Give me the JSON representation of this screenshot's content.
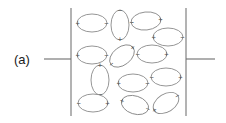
{
  "figure": {
    "panel_label": "(a)",
    "width": 226,
    "height": 123,
    "colors": {
      "background": "#ffffff",
      "plate_stroke": "#808080",
      "lead_stroke": "#6e6e6e",
      "dipole_stroke": "#8a8a8a",
      "dipole_fill": "#ffffff",
      "charge_text": "#4a4a4a",
      "label_text": "#1a1a1a"
    },
    "plates": [
      {
        "name": "left-plate",
        "x": 71,
        "y1": 8,
        "y2": 116
      },
      {
        "name": "right-plate",
        "x": 186,
        "y1": 8,
        "y2": 116
      }
    ],
    "leads": [
      {
        "name": "left-lead",
        "x1": 44,
        "y1": 59,
        "x2": 71,
        "y2": 59
      },
      {
        "name": "right-lead",
        "x1": 186,
        "y1": 59,
        "x2": 215,
        "y2": 59
      }
    ],
    "label_position": {
      "x": 14,
      "y": 60
    },
    "dipoles": [
      {
        "id": 1,
        "cx": 92,
        "cy": 23,
        "rx": 15,
        "ry": 9,
        "rotation": 0,
        "plus": "+",
        "minus": "−",
        "plus_side": "left"
      },
      {
        "id": 2,
        "cx": 120,
        "cy": 25,
        "rx": 9,
        "ry": 15,
        "rotation": 0,
        "plus": "+",
        "minus": "−",
        "plus_side": "bottom"
      },
      {
        "id": 3,
        "cx": 146,
        "cy": 21,
        "rx": 15,
        "ry": 9,
        "rotation": -6,
        "plus": "+",
        "minus": "−",
        "plus_side": "right"
      },
      {
        "id": 4,
        "cx": 168,
        "cy": 37,
        "rx": 15,
        "ry": 9,
        "rotation": 0,
        "plus": "+",
        "minus": "−",
        "plus_side": "left"
      },
      {
        "id": 5,
        "cx": 92,
        "cy": 55,
        "rx": 15,
        "ry": 9,
        "rotation": 0,
        "plus": "+",
        "minus": "−",
        "plus_side": "left"
      },
      {
        "id": 6,
        "cx": 122,
        "cy": 56,
        "rx": 14,
        "ry": 9,
        "rotation": -38,
        "plus": "+",
        "minus": "−",
        "plus_side": "right"
      },
      {
        "id": 7,
        "cx": 152,
        "cy": 54,
        "rx": 15,
        "ry": 9,
        "rotation": 0,
        "plus": "+",
        "minus": "−",
        "plus_side": "right"
      },
      {
        "id": 8,
        "cx": 100,
        "cy": 80,
        "rx": 9,
        "ry": 15,
        "rotation": 0,
        "plus": "+",
        "minus": "−",
        "plus_side": "top"
      },
      {
        "id": 9,
        "cx": 133,
        "cy": 83,
        "rx": 15,
        "ry": 9,
        "rotation": 0,
        "plus": "+",
        "minus": "−",
        "plus_side": "left"
      },
      {
        "id": 10,
        "cx": 166,
        "cy": 77,
        "rx": 15,
        "ry": 9,
        "rotation": 0,
        "plus": "+",
        "minus": "−",
        "plus_side": "right"
      },
      {
        "id": 11,
        "cx": 93,
        "cy": 103,
        "rx": 15,
        "ry": 9,
        "rotation": 0,
        "plus": "+",
        "minus": "−",
        "plus_side": "right"
      },
      {
        "id": 12,
        "cx": 135,
        "cy": 105,
        "rx": 14,
        "ry": 9,
        "rotation": 18,
        "plus": "+",
        "minus": "−",
        "plus_side": "left"
      },
      {
        "id": 13,
        "cx": 166,
        "cy": 103,
        "rx": 14,
        "ry": 9,
        "rotation": -32,
        "plus": "+",
        "minus": "−",
        "plus_side": "left"
      }
    ]
  }
}
